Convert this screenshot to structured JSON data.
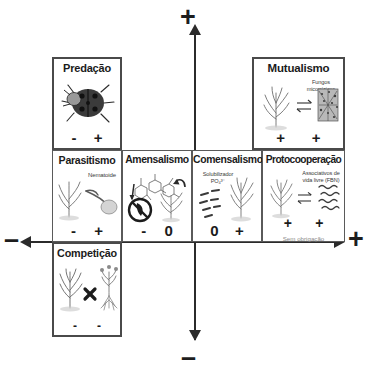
{
  "diagram": {
    "axes": {
      "top_sign": "+",
      "bottom_sign": "–",
      "left_sign": "–",
      "right_sign": "+"
    },
    "colors": {
      "line": "#2b2b2b",
      "box_border": "#5a5a5a",
      "text": "#1b1b1b",
      "muted": "#8a8a8a"
    }
  },
  "boxes": [
    {
      "id": "predacao",
      "label": "Predação",
      "signs": [
        "-",
        "+"
      ],
      "caption": "",
      "subnote": "",
      "icon": "ladybug-icon"
    },
    {
      "id": "mutualismo",
      "label": "Mutualismo",
      "signs": [
        "+",
        "+"
      ],
      "caption": "Fungos\nmicorrízicos",
      "subnote": "",
      "icon": "plant-mycorrhiza-icon"
    },
    {
      "id": "parasitismo",
      "label": "Parasitismo",
      "signs": [
        "-",
        "+"
      ],
      "caption": "Nematoide",
      "subnote": "",
      "icon": "plant-nematode-icon"
    },
    {
      "id": "amensalismo",
      "label": "Amensalismo",
      "signs": [
        "-",
        "0"
      ],
      "caption": "",
      "subnote": "",
      "icon": "allelochemical-inhibition-icon"
    },
    {
      "id": "comensalismo",
      "label": "Comensalismo",
      "signs": [
        "0",
        "+"
      ],
      "caption": "Solubilizador\nPO₄³⁻",
      "subnote": "",
      "icon": "bacteria-plant-icon"
    },
    {
      "id": "protocooperacao",
      "label": "Protocooperação",
      "signs": [
        "+",
        "+"
      ],
      "caption": "Associativos de\nvida livre (FBN)",
      "subnote": "Sem obrigação",
      "icon": "plant-freeliving-bacteria-icon"
    },
    {
      "id": "competicao",
      "label": "Competição",
      "signs": [
        "-",
        "-"
      ],
      "caption": "",
      "subnote": "",
      "icon": "two-plants-cross-icon"
    }
  ]
}
